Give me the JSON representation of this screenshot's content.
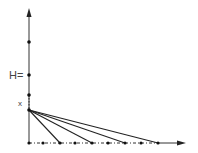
{
  "diagram": {
    "labels": {
      "h_label": "H=",
      "x_label": "x"
    },
    "colors": {
      "line": "#222222",
      "axis": "#333333",
      "background": "#ffffff"
    },
    "axes": {
      "origin": [
        29,
        143
      ],
      "vertical_top": [
        29,
        10
      ],
      "horizontal_end": [
        185,
        143
      ]
    },
    "vertical_points_y": [
      42,
      75,
      95
    ],
    "apex": [
      29,
      110
    ],
    "horizontal_points_x": [
      29,
      43,
      60,
      75,
      92,
      108,
      125,
      141,
      158
    ],
    "ray_targets_x": [
      60,
      92,
      125,
      158
    ]
  }
}
